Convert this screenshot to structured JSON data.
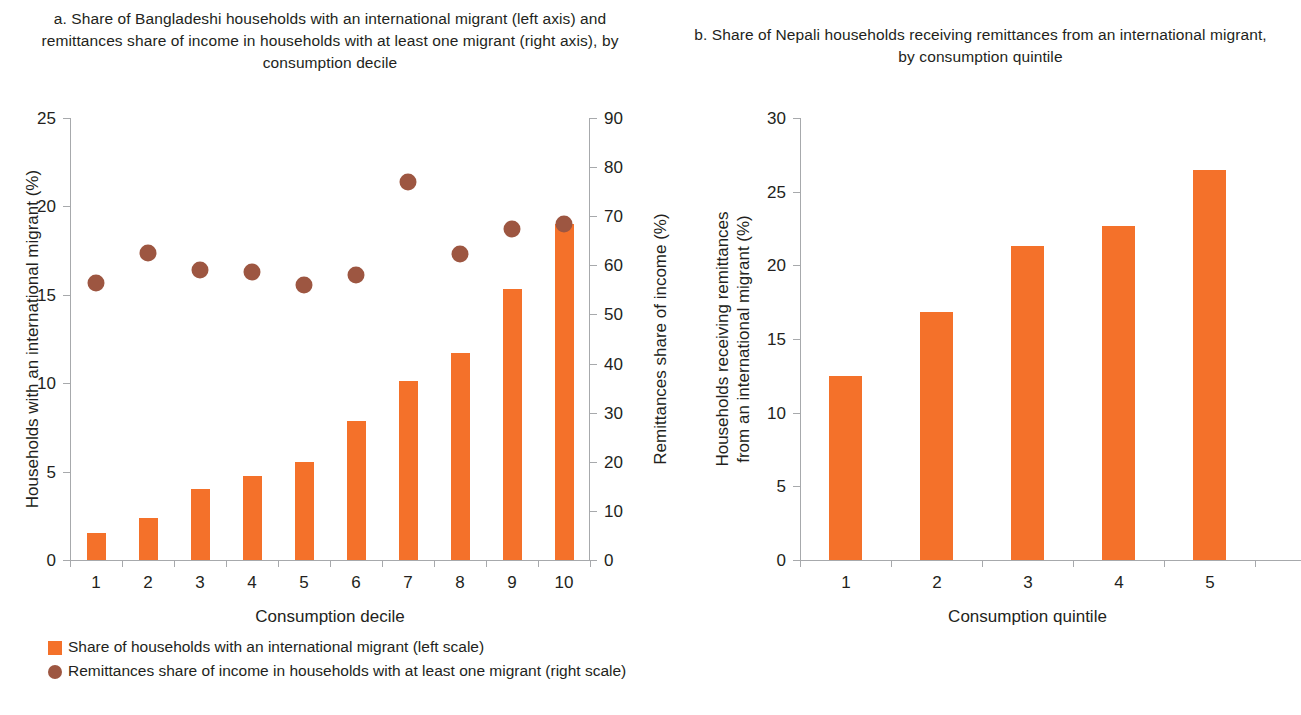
{
  "panel_a": {
    "title": "a. Share of Bangladeshi households with an international migrant (left axis) and remittances share of income in households with at least one migrant (right axis), by consumption decile",
    "y_left_title": "Households with an international migrant (%)",
    "y_right_title": "Remittances share of income (%)",
    "x_title": "Consumption decile",
    "y_left_ticks": [
      "0",
      "5",
      "10",
      "15",
      "20",
      "25"
    ],
    "y_right_ticks": [
      "0",
      "10",
      "20",
      "30",
      "40",
      "50",
      "60",
      "70",
      "80",
      "90"
    ],
    "x_ticks": [
      "1",
      "2",
      "3",
      "4",
      "5",
      "6",
      "7",
      "8",
      "9",
      "10"
    ]
  },
  "panel_b": {
    "title": "b. Share of Nepali households receiving remittances from an international migrant, by consumption quintile",
    "y_title_line1": "Households receiving remittances",
    "y_title_line2": "from an international migrant (%)",
    "x_title": "Consumption quintile",
    "y_ticks": [
      "0",
      "5",
      "10",
      "15",
      "20",
      "25",
      "30"
    ],
    "x_ticks": [
      "1",
      "2",
      "3",
      "4",
      "5"
    ]
  },
  "legend": {
    "bars_label": "Share of households with an international migrant (left scale)",
    "dots_label": "Remittances share of income in households with at least one migrant (right scale)",
    "bars_color": "#f4712a",
    "dots_color": "#9d5641"
  },
  "chart_data": [
    {
      "type": "bar",
      "panel": "a",
      "title": "a. Share of Bangladeshi households with an international migrant (left axis) and remittances share of income in households with at least one migrant (right axis), by consumption decile",
      "xlabel": "Consumption decile",
      "ylabel": "Households with an international migrant (%)",
      "ylabel_secondary": "Remittances share of income (%)",
      "categories": [
        "1",
        "2",
        "3",
        "4",
        "5",
        "6",
        "7",
        "8",
        "9",
        "10"
      ],
      "ylim": [
        0,
        25
      ],
      "ylim_secondary": [
        0,
        90
      ],
      "ytick_step": 5,
      "ytick_step_secondary": 10,
      "grid": false,
      "legend_position": "below-left",
      "series": [
        {
          "name": "Share of households with an international migrant (left scale)",
          "type": "bar",
          "axis": "left",
          "color": "#f4712a",
          "values": [
            1.5,
            2.35,
            4.0,
            4.75,
            5.55,
            7.85,
            10.1,
            11.7,
            15.35,
            19.0
          ]
        },
        {
          "name": "Remittances share of income in households with at least one migrant (right scale)",
          "type": "scatter",
          "axis": "right",
          "color": "#9d5641",
          "values": [
            56.5,
            62.5,
            59.0,
            58.7,
            56.0,
            58.1,
            76.9,
            62.3,
            67.3,
            68.5
          ]
        }
      ]
    },
    {
      "type": "bar",
      "panel": "b",
      "title": "b. Share of Nepali households receiving remittances from an international migrant, by consumption quintile",
      "xlabel": "Consumption quintile",
      "ylabel": "Households receiving remittances from an international migrant (%)",
      "categories": [
        "1",
        "2",
        "3",
        "4",
        "5"
      ],
      "ylim": [
        0,
        30
      ],
      "ytick_step": 5,
      "grid": false,
      "series": [
        {
          "name": "Households receiving remittances from an international migrant",
          "type": "bar",
          "color": "#f4712a",
          "values": [
            12.5,
            16.8,
            21.3,
            22.7,
            26.5
          ]
        }
      ]
    }
  ]
}
